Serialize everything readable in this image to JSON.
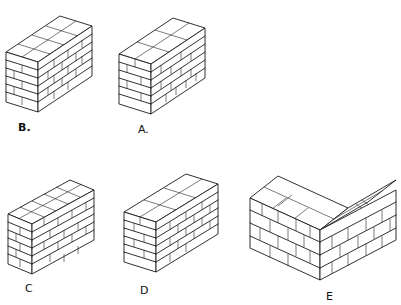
{
  "figures": [
    {
      "id": "B",
      "label": "B.",
      "description": "Brick wall sketch, bond B",
      "courses": 6
    },
    {
      "id": "A",
      "label": "A.",
      "description": "Brick wall sketch, bond A",
      "courses": 6
    },
    {
      "id": "C",
      "label": "C",
      "description": "Brick wall sketch, bond C",
      "courses": 6
    },
    {
      "id": "D",
      "label": "D",
      "description": "Brick wall sketch, bond D",
      "courses": 6
    },
    {
      "id": "E",
      "label": "E",
      "description": "Brick corner (L-shaped) wall sketch, bond E",
      "courses": 4
    }
  ],
  "colors": {
    "ink": "#1a1a1a",
    "paper": "#ffffff"
  }
}
